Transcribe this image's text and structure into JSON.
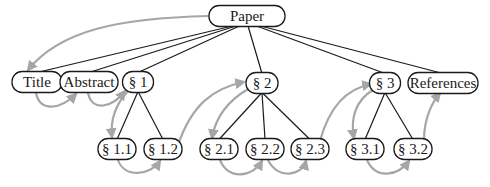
{
  "diagram": {
    "type": "tree-with-reading-order",
    "colors": {
      "node_border": "#1a1a1a",
      "tree_edge": "#1a1a1a",
      "flow_edge": "#a6a6a6",
      "background": "#ffffff"
    },
    "nodes": [
      {
        "id": "paper",
        "label": "Paper"
      },
      {
        "id": "title",
        "label": "Title"
      },
      {
        "id": "abstract",
        "label": "Abstract"
      },
      {
        "id": "s1",
        "label": "§ 1"
      },
      {
        "id": "s2",
        "label": "§ 2"
      },
      {
        "id": "s3",
        "label": "§ 3"
      },
      {
        "id": "refs",
        "label": "References"
      },
      {
        "id": "s11",
        "label": "§ 1.1"
      },
      {
        "id": "s12",
        "label": "§ 1.2"
      },
      {
        "id": "s21",
        "label": "§ 2.1"
      },
      {
        "id": "s22",
        "label": "§ 2.2"
      },
      {
        "id": "s23",
        "label": "§ 2.3"
      },
      {
        "id": "s31",
        "label": "§ 3.1"
      },
      {
        "id": "s32",
        "label": "§ 3.2"
      }
    ],
    "tree_edges": [
      [
        "paper",
        "title"
      ],
      [
        "paper",
        "abstract"
      ],
      [
        "paper",
        "s1"
      ],
      [
        "paper",
        "s2"
      ],
      [
        "paper",
        "s3"
      ],
      [
        "paper",
        "refs"
      ],
      [
        "s1",
        "s11"
      ],
      [
        "s1",
        "s12"
      ],
      [
        "s2",
        "s21"
      ],
      [
        "s2",
        "s22"
      ],
      [
        "s2",
        "s23"
      ],
      [
        "s3",
        "s31"
      ],
      [
        "s3",
        "s32"
      ]
    ],
    "reading_order": [
      "paper",
      "title",
      "abstract",
      "s1",
      "s11",
      "s12",
      "s2",
      "s21",
      "s22",
      "s23",
      "s3",
      "s31",
      "s32",
      "refs"
    ]
  }
}
